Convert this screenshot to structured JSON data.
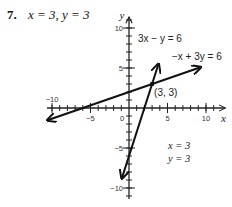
{
  "problem": {
    "number": "7.",
    "text": "x = 3, y = 3"
  },
  "chart_data": {
    "type": "line",
    "title": "",
    "xlabel": "x",
    "ylabel": "y",
    "xlim": [
      -10,
      12
    ],
    "ylim": [
      -11,
      11.5
    ],
    "x_ticks": [
      -10,
      -5,
      0,
      5,
      10
    ],
    "x_tick_labels": [
      "-10",
      "-5",
      "0",
      "5",
      "10"
    ],
    "y_ticks": [
      -10,
      -5,
      5,
      10
    ],
    "y_tick_labels": [
      "-10",
      "-5",
      "5",
      "10"
    ],
    "grid": false,
    "series": [
      {
        "name": "3x - y = 6",
        "label": "3x − y = 6",
        "points": [
          [
            -0.9,
            -8.7
          ],
          [
            3.8,
            5.4
          ]
        ],
        "arrows": "both"
      },
      {
        "name": "-x + 3y = 6",
        "label": "−x + 3y = 6",
        "points": [
          [
            -10.5,
            -1.5
          ],
          [
            9.2,
            5.07
          ]
        ],
        "arrows": "both"
      }
    ],
    "annotations": [
      {
        "text": "(3, 3)",
        "x": 3,
        "y": 3
      },
      {
        "text": "x = 3",
        "position": "lower-right"
      },
      {
        "text": "y = 3",
        "position": "lower-right"
      }
    ]
  }
}
